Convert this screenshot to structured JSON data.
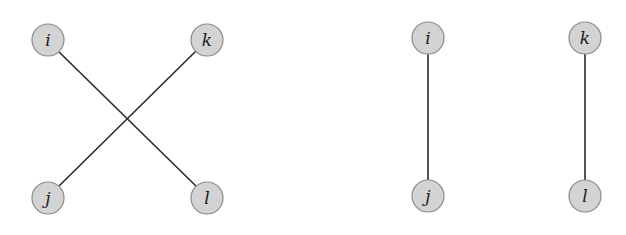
{
  "diagram": {
    "node_radius": 16,
    "colors": {
      "node_fill": "#d3d3d3",
      "node_stroke": "#8a8a8a",
      "edge": "#2a2a2a",
      "label": "#1a1a1a"
    },
    "left_graph": {
      "description": "crossing pairing",
      "nodes": {
        "i": {
          "label": "i",
          "x": 48,
          "y": 40
        },
        "k": {
          "label": "k",
          "x": 207,
          "y": 40
        },
        "j": {
          "label": "j",
          "x": 48,
          "y": 198
        },
        "l": {
          "label": "l",
          "x": 207,
          "y": 198
        }
      },
      "edges": [
        {
          "from": "i",
          "to": "l"
        },
        {
          "from": "k",
          "to": "j"
        }
      ]
    },
    "right_graph": {
      "description": "parallel pairing",
      "nodes": {
        "i": {
          "label": "i",
          "x": 428,
          "y": 38
        },
        "k": {
          "label": "k",
          "x": 585,
          "y": 38
        },
        "j": {
          "label": "j",
          "x": 428,
          "y": 196
        },
        "l": {
          "label": "l",
          "x": 585,
          "y": 196
        }
      },
      "edges": [
        {
          "from": "i",
          "to": "j"
        },
        {
          "from": "k",
          "to": "l"
        }
      ]
    }
  }
}
